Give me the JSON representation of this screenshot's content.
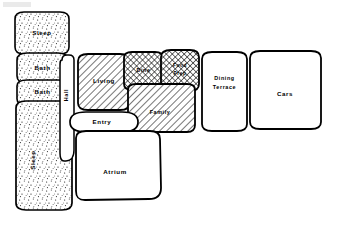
{
  "diagram": {
    "type": "bubble-adjacency-diagram",
    "background": "#ffffff",
    "line_color": "#000000",
    "fills": {
      "stipple": "#ffffff",
      "diagonal_hatch": "#ffffff",
      "cross_hatch": "#ffffff",
      "plain": "#ffffff"
    },
    "bubbles": [
      {
        "id": "sleep-top",
        "label": "Sleep",
        "fill": "stipple",
        "orientation": "horizontal"
      },
      {
        "id": "bath-upper",
        "label": "Bath",
        "fill": "stipple",
        "orientation": "horizontal"
      },
      {
        "id": "bath-lower",
        "label": "Bath",
        "fill": "stipple",
        "orientation": "horizontal"
      },
      {
        "id": "sleep-bottom",
        "label": "Sleep",
        "fill": "stipple",
        "orientation": "vertical"
      },
      {
        "id": "hall",
        "label": "Hall",
        "fill": "plain",
        "orientation": "vertical"
      },
      {
        "id": "living",
        "label": "Living",
        "fill": "diagonal_hatch",
        "orientation": "horizontal"
      },
      {
        "id": "dine",
        "label": "Dine",
        "fill": "cross_hatch",
        "orientation": "horizontal"
      },
      {
        "id": "food-prep",
        "label": "Food Prep",
        "fill": "cross_hatch",
        "orientation": "horizontal"
      },
      {
        "id": "family",
        "label": "Family",
        "fill": "diagonal_hatch",
        "orientation": "horizontal"
      },
      {
        "id": "entry",
        "label": "Entry",
        "fill": "plain",
        "orientation": "horizontal"
      },
      {
        "id": "atrium",
        "label": "Atrium",
        "fill": "plain",
        "orientation": "horizontal"
      },
      {
        "id": "dining-terrace",
        "label": "Dining Terrace",
        "fill": "plain",
        "orientation": "horizontal"
      },
      {
        "id": "cars",
        "label": "Cars",
        "fill": "plain",
        "orientation": "horizontal"
      }
    ],
    "labels": {
      "sleep_top": "Sleep",
      "bath_upper": "Bath",
      "bath_lower": "Bath",
      "sleep_bottom": "Sleep",
      "hall": "Hall",
      "living": "Living",
      "dine": "Dine",
      "food_prep_line1": "Food",
      "food_prep_line2": "Prep",
      "family": "Family",
      "entry": "Entry",
      "atrium": "Atrium",
      "dining_terrace_line1": "Dining",
      "dining_terrace_line2": "Terrace",
      "cars": "Cars"
    }
  }
}
